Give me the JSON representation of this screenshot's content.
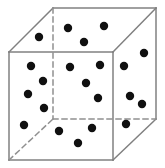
{
  "figure": {
    "name": "particles-in-a-cube",
    "background_color": "#ffffff",
    "width": 165,
    "height": 168
  },
  "cube": {
    "label": "cube-wireframe",
    "edge_color": "#808080",
    "hidden_edge_color": "#909090",
    "edge_width": 1.5,
    "hidden_edge_dash": "5,4",
    "vertices": {
      "front_top_left": [
        9,
        52
      ],
      "front_top_right": [
        113,
        52
      ],
      "front_bottom_left": [
        9,
        160
      ],
      "front_bottom_right": [
        113,
        160
      ],
      "back_top_left": [
        53,
        8
      ],
      "back_top_right": [
        156,
        8
      ],
      "back_bottom_left": [
        53,
        119
      ],
      "back_bottom_right": [
        156,
        119
      ]
    },
    "visible_edges": [
      [
        "front_top_left",
        "front_top_right"
      ],
      [
        "front_top_right",
        "front_bottom_right"
      ],
      [
        "front_bottom_right",
        "front_bottom_left"
      ],
      [
        "front_bottom_left",
        "front_top_left"
      ],
      [
        "back_top_left",
        "back_top_right"
      ],
      [
        "back_top_right",
        "back_bottom_right"
      ],
      [
        "front_top_left",
        "back_top_left"
      ],
      [
        "front_top_right",
        "back_top_right"
      ],
      [
        "front_bottom_right",
        "back_bottom_right"
      ]
    ],
    "hidden_edges": [
      [
        "back_top_left",
        "back_bottom_left"
      ],
      [
        "back_bottom_left",
        "back_bottom_right"
      ],
      [
        "front_bottom_left",
        "back_bottom_left"
      ]
    ]
  },
  "particles": {
    "label": "particles",
    "color": "#101010",
    "radius": 4.2,
    "count": 21,
    "points": [
      [
        39,
        37
      ],
      [
        68,
        28
      ],
      [
        84,
        42
      ],
      [
        104,
        26
      ],
      [
        144,
        53
      ],
      [
        31,
        66
      ],
      [
        43,
        81
      ],
      [
        28,
        94
      ],
      [
        44,
        108
      ],
      [
        70,
        67
      ],
      [
        100,
        65
      ],
      [
        86,
        83
      ],
      [
        98,
        98
      ],
      [
        124,
        66
      ],
      [
        130,
        96
      ],
      [
        142,
        104
      ],
      [
        24,
        125
      ],
      [
        59,
        131
      ],
      [
        92,
        128
      ],
      [
        78,
        143
      ],
      [
        126,
        124
      ]
    ]
  }
}
